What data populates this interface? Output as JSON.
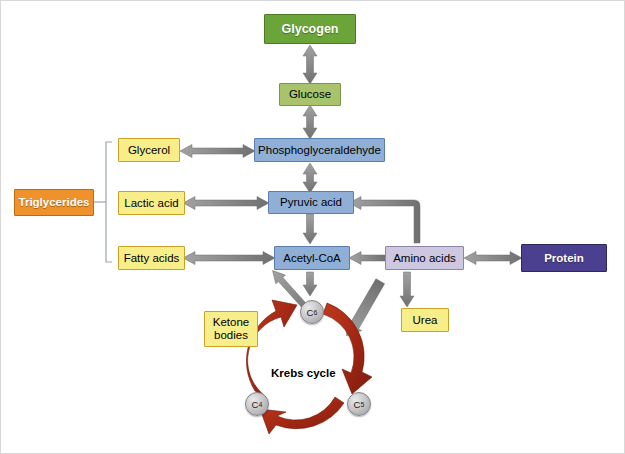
{
  "diagram": {
    "colors": {
      "glycogen": "#6ba539",
      "glucose": "#a8c36b",
      "intermediate_blue": "#8fafd6",
      "nutrient_yellow": "#f7ee8a",
      "triglycerides_orange": "#f0922b",
      "protein_purple": "#4b3f8f",
      "amino_acids_lavender": "#cdc7e0",
      "arrow_gray": "#8a8a8a",
      "krebs_red": "#a82b17",
      "bracket_gray": "#9aa3b0"
    },
    "nodes": {
      "glycogen": "Glycogen",
      "glucose": "Glucose",
      "phosphoglyceraldehyde": "Phosphoglyceraldehyde",
      "pyruvic_acid": "Pyruvic acid",
      "acetyl_coa": "Acetyl-CoA",
      "glycerol": "Glycerol",
      "lactic_acid": "Lactic acid",
      "fatty_acids": "Fatty acids",
      "triglycerides": "Triglycerides",
      "amino_acids": "Amino acids",
      "protein": "Protein",
      "urea": "Urea",
      "ketone_bodies_line1": "Ketone",
      "ketone_bodies_line2": "bodies"
    },
    "krebs": {
      "label": "Krebs cycle",
      "carbons": [
        {
          "id": "c6",
          "letter": "C",
          "subscript": "6"
        },
        {
          "id": "c5",
          "letter": "C",
          "subscript": "5"
        },
        {
          "id": "c4",
          "letter": "C",
          "subscript": "4"
        }
      ]
    }
  }
}
